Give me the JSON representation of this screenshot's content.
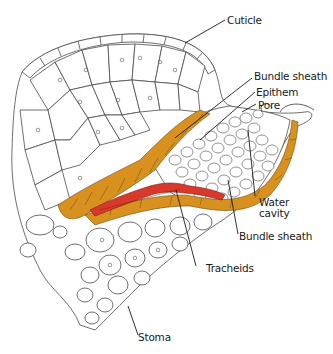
{
  "figure": {
    "labels": [
      {
        "id": "cuticle",
        "text": "Cuticle"
      },
      {
        "id": "bundle-sheath-top",
        "text": "Bundle sheath"
      },
      {
        "id": "epithem",
        "text": "Epithem"
      },
      {
        "id": "pore",
        "text": "Pore"
      },
      {
        "id": "water-cavity",
        "text": "Water\ncavity"
      },
      {
        "id": "bundle-sheath-bottom",
        "text": "Bundle sheath"
      },
      {
        "id": "tracheids",
        "text": "Tracheids"
      },
      {
        "id": "stoma",
        "text": "Stoma"
      }
    ],
    "colors": {
      "bundle_sheath": "#d8901e",
      "tracheids": "#d9392a",
      "cell_outline": "#4a4a4a",
      "background": "#ffffff"
    }
  }
}
